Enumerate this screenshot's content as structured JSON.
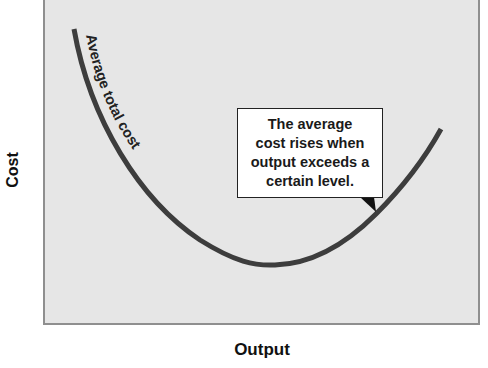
{
  "diagram": {
    "axes": {
      "y_label": "Cost",
      "x_label": "Output"
    },
    "curve": {
      "label": "Average total cost",
      "color": "#3d3d3d"
    },
    "callout": {
      "lines": [
        "The average",
        "cost rises when",
        "output exceeds a",
        "certain level."
      ]
    },
    "colors": {
      "plot_background": "#e6e6e6",
      "plot_border": "#8f8f8f"
    }
  }
}
